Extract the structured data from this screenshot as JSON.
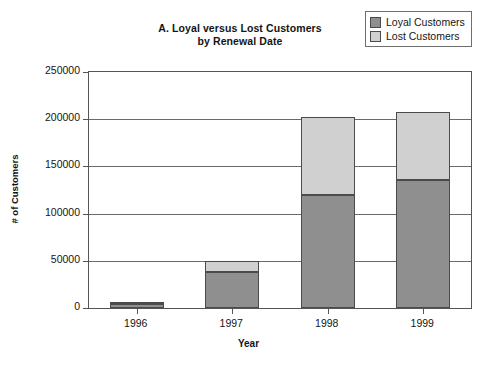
{
  "chart_data": {
    "type": "bar",
    "subtype": "stacked-column",
    "title": "A. Loyal versus Lost Customers by Renewal Date",
    "title_lines": [
      "A. Loyal versus Lost Customers",
      "by Renewal Date"
    ],
    "xlabel": "Year",
    "ylabel": "# of Customers",
    "categories": [
      "1996",
      "1997",
      "1998",
      "1999"
    ],
    "series": [
      {
        "name": "Loyal Customers",
        "color": "#8f8f8f",
        "values": [
          4000,
          38000,
          120000,
          136000
        ]
      },
      {
        "name": "Lost Customers",
        "color": "#d0d0d0",
        "values": [
          1000,
          12000,
          82000,
          72000
        ]
      }
    ],
    "totals": [
      5000,
      50000,
      202000,
      208000
    ],
    "ylim": [
      0,
      250000
    ],
    "yticks": [
      0,
      50000,
      100000,
      150000,
      200000,
      250000
    ],
    "ytick_labels": [
      "0",
      "50000",
      "100000",
      "150000",
      "200000",
      "250000"
    ],
    "grid": true,
    "grid_axis": "y",
    "legend_position": "top-right",
    "legend_entries": [
      "Loyal Customers",
      "Lost Customers"
    ]
  },
  "legend": {
    "items": [
      {
        "label": "Loyal Customers",
        "color": "#8f8f8f"
      },
      {
        "label": "Lost Customers",
        "color": "#d0d0d0"
      }
    ]
  },
  "axes": {
    "y_title": "# of Customers",
    "x_title": "Year"
  }
}
